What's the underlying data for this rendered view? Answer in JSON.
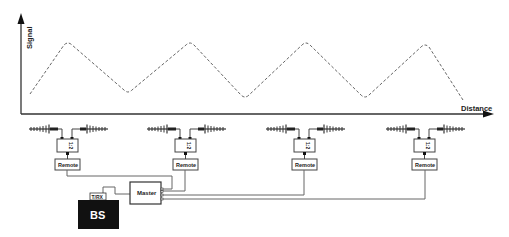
{
  "diagram": {
    "y_axis_label": "Signal",
    "x_axis_label": "Distance",
    "splitter_label": "1:2",
    "remote_label": "Remote",
    "master_label": "Master",
    "trx_label": "T/RX",
    "bs_label": "BS",
    "colors": {
      "line": "#555555",
      "axis": "#333333",
      "bs_fill": "#111111",
      "bs_text": "#ffffff",
      "wave": "#666666"
    },
    "remote_units": [
      {
        "id": 1,
        "label": "Remote",
        "splitter": "1:2"
      },
      {
        "id": 2,
        "label": "Remote",
        "splitter": "1:2"
      },
      {
        "id": 3,
        "label": "Remote",
        "splitter": "1:2"
      },
      {
        "id": 4,
        "label": "Remote",
        "splitter": "1:2"
      }
    ]
  }
}
